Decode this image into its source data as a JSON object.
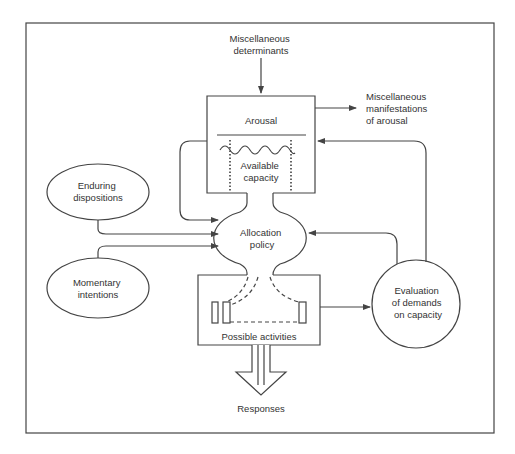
{
  "diagram": {
    "nodes": {
      "misc_determinants": [
        "Miscellaneous",
        "determinants"
      ],
      "arousal": "Arousal",
      "available_capacity": [
        "Available",
        "capacity"
      ],
      "misc_manifestations": [
        "Miscellaneous",
        "manifestations",
        "of arousal"
      ],
      "enduring_dispositions": [
        "Enduring",
        "dispositions"
      ],
      "momentary_intentions": [
        "Momentary",
        "intentions"
      ],
      "allocation_policy": [
        "Allocation",
        "policy"
      ],
      "evaluation": [
        "Evaluation",
        "of demands",
        "on capacity"
      ],
      "possible_activities": "Possible activities",
      "responses": "Responses"
    },
    "edges": [
      {
        "from": "misc_determinants",
        "to": "arousal"
      },
      {
        "from": "arousal",
        "to": "misc_manifestations"
      },
      {
        "from": "arousal",
        "to": "allocation_policy"
      },
      {
        "from": "enduring_dispositions",
        "to": "allocation_policy"
      },
      {
        "from": "momentary_intentions",
        "to": "allocation_policy"
      },
      {
        "from": "evaluation",
        "to": "allocation_policy"
      },
      {
        "from": "evaluation",
        "to": "arousal"
      },
      {
        "from": "possible_activities",
        "to": "evaluation"
      },
      {
        "from": "possible_activities",
        "to": "responses"
      }
    ]
  }
}
